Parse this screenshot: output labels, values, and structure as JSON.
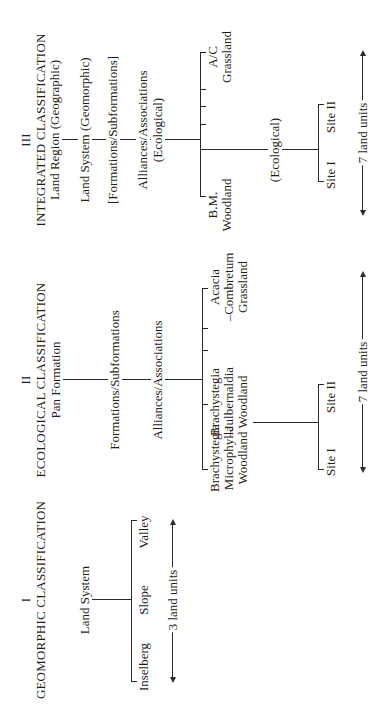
{
  "sections": {
    "geomorphic": {
      "numeral": "I",
      "title": "GEOMORPHIC CLASSIFICATION",
      "root": "Land System",
      "children": [
        "Inselberg",
        "Slope",
        "Valley"
      ],
      "span_label": "3 land units"
    },
    "ecological": {
      "numeral": "II",
      "title": "ECOLOGICAL CLASSIFICATION",
      "levels": [
        "Pan Formation",
        "Formations/Subformations",
        "Alliances/Associations"
      ],
      "children": [
        {
          "lines": [
            "Brachystegia",
            "Microphylla",
            "Woodland"
          ]
        },
        {
          "lines": [
            "Brachystegia",
            "–Julbernaldia",
            "Woodland"
          ]
        },
        {
          "lines": [
            "Acacia",
            "–Combretum",
            "Grassland"
          ]
        }
      ],
      "sites": [
        "Site I",
        "Site II"
      ],
      "span_label": "7 land units"
    },
    "integrated": {
      "numeral": "III",
      "title": "INTEGRATED CLASSIFICATION",
      "levels": [
        {
          "label": "Land Region (Geographic)"
        },
        {
          "label": "Land System (Geomorphic)"
        },
        {
          "label": "[Formations/Subformations]"
        },
        {
          "label": "Alliances/Associations",
          "sub": "(Ecological)"
        }
      ],
      "children": [
        {
          "lines": [
            "B.M.",
            "Woodland"
          ]
        },
        {
          "lines": [
            "A/C",
            "Grassland"
          ]
        }
      ],
      "site_link_label": "(Ecological)",
      "sites": [
        "Site I",
        "Site II"
      ],
      "span_label": "7 land units"
    }
  }
}
